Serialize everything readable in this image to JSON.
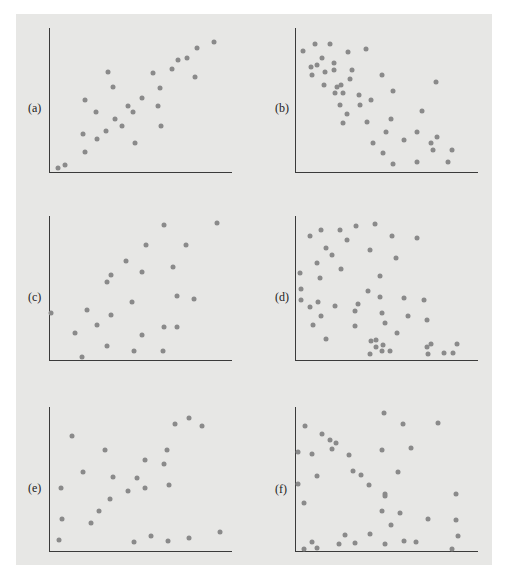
{
  "caption": "Figure",
  "chart_data": [
    {
      "type": "scatter",
      "panel": "(a)",
      "label": "(a)",
      "xlabel": "",
      "ylabel": "",
      "grid": false,
      "trend": "strong positive",
      "points": [
        [
          9,
          5
        ],
        [
          16,
          8
        ],
        [
          36,
          21
        ],
        [
          34,
          39
        ],
        [
          36,
          73
        ],
        [
          48,
          34
        ],
        [
          47,
          61
        ],
        [
          57,
          42
        ],
        [
          59,
          101
        ],
        [
          64,
          86
        ],
        [
          66,
          54
        ],
        [
          73,
          47
        ],
        [
          79,
          67
        ],
        [
          84,
          61
        ],
        [
          86,
          30
        ],
        [
          93,
          75
        ],
        [
          104,
          100
        ],
        [
          109,
          67
        ],
        [
          111,
          85
        ],
        [
          112,
          47
        ],
        [
          123,
          104
        ],
        [
          129,
          113
        ],
        [
          138,
          115
        ],
        [
          146,
          96
        ],
        [
          148,
          125
        ],
        [
          165,
          131
        ]
      ]
    },
    {
      "type": "scatter",
      "panel": "(b)",
      "label": "(b)",
      "xlabel": "",
      "ylabel": "",
      "grid": false,
      "trend": "negative",
      "points": [
        [
          8,
          122
        ],
        [
          20,
          129
        ],
        [
          35,
          129
        ],
        [
          53,
          121
        ],
        [
          71,
          124
        ],
        [
          16,
          106
        ],
        [
          22,
          108
        ],
        [
          27,
          115
        ],
        [
          39,
          110
        ],
        [
          17,
          98
        ],
        [
          30,
          101
        ],
        [
          39,
          103
        ],
        [
          57,
          103
        ],
        [
          55,
          94
        ],
        [
          29,
          88
        ],
        [
          42,
          86
        ],
        [
          46,
          88
        ],
        [
          40,
          80
        ],
        [
          48,
          80
        ],
        [
          64,
          78
        ],
        [
          65,
          68
        ],
        [
          76,
          73
        ],
        [
          45,
          68
        ],
        [
          52,
          59
        ],
        [
          48,
          50
        ],
        [
          72,
          51
        ],
        [
          87,
          98
        ],
        [
          98,
          82
        ],
        [
          96,
          54
        ],
        [
          91,
          41
        ],
        [
          78,
          30
        ],
        [
          88,
          20
        ],
        [
          98,
          9
        ],
        [
          109,
          33
        ],
        [
          122,
          41
        ],
        [
          127,
          62
        ],
        [
          141,
          91
        ],
        [
          122,
          11
        ],
        [
          136,
          30
        ],
        [
          142,
          36
        ],
        [
          138,
          23
        ],
        [
          157,
          23
        ],
        [
          153,
          11
        ]
      ]
    },
    {
      "type": "scatter",
      "panel": "(c)",
      "label": "(c)",
      "xlabel": "",
      "ylabel": "",
      "grid": false,
      "trend": "weak positive",
      "points": [
        [
          2,
          48
        ],
        [
          26,
          28
        ],
        [
          33,
          4
        ],
        [
          38,
          51
        ],
        [
          48,
          36
        ],
        [
          58,
          15
        ],
        [
          62,
          46
        ],
        [
          58,
          79
        ],
        [
          62,
          86
        ],
        [
          77,
          100
        ],
        [
          83,
          59
        ],
        [
          85,
          10
        ],
        [
          93,
          89
        ],
        [
          93,
          26
        ],
        [
          97,
          116
        ],
        [
          115,
          136
        ],
        [
          114,
          10
        ],
        [
          115,
          34
        ],
        [
          124,
          94
        ],
        [
          128,
          65
        ],
        [
          128,
          34
        ],
        [
          137,
          116
        ],
        [
          145,
          62
        ],
        [
          168,
          138
        ]
      ]
    },
    {
      "type": "scatter",
      "panel": "(d)",
      "label": "(d)",
      "xlabel": "",
      "ylabel": "",
      "grid": false,
      "trend": "weak negative",
      "points": [
        [
          15,
          125
        ],
        [
          26,
          131
        ],
        [
          45,
          131
        ],
        [
          61,
          135
        ],
        [
          80,
          137
        ],
        [
          52,
          121
        ],
        [
          97,
          125
        ],
        [
          122,
          123
        ],
        [
          31,
          113
        ],
        [
          37,
          106
        ],
        [
          75,
          111
        ],
        [
          101,
          103
        ],
        [
          22,
          98
        ],
        [
          46,
          92
        ],
        [
          5,
          88
        ],
        [
          25,
          83
        ],
        [
          85,
          85
        ],
        [
          6,
          72
        ],
        [
          6,
          61
        ],
        [
          73,
          70
        ],
        [
          85,
          64
        ],
        [
          109,
          63
        ],
        [
          129,
          61
        ],
        [
          15,
          54
        ],
        [
          23,
          59
        ],
        [
          40,
          55
        ],
        [
          63,
          57
        ],
        [
          60,
          50
        ],
        [
          26,
          45
        ],
        [
          87,
          48
        ],
        [
          113,
          45
        ],
        [
          132,
          41
        ],
        [
          18,
          36
        ],
        [
          60,
          35
        ],
        [
          90,
          38
        ],
        [
          102,
          28
        ],
        [
          31,
          22
        ],
        [
          76,
          20
        ],
        [
          81,
          21
        ],
        [
          81,
          14
        ],
        [
          88,
          16
        ],
        [
          75,
          7
        ],
        [
          87,
          10
        ],
        [
          95,
          10
        ],
        [
          132,
          14
        ],
        [
          136,
          17
        ],
        [
          133,
          7
        ],
        [
          149,
          8
        ],
        [
          158,
          8
        ],
        [
          162,
          17
        ]
      ]
    },
    {
      "type": "scatter",
      "panel": "(e)",
      "label": "(e)",
      "xlabel": "",
      "ylabel": "",
      "grid": false,
      "trend": "weak positive",
      "points": [
        [
          10,
          12
        ],
        [
          13,
          33
        ],
        [
          12,
          64
        ],
        [
          23,
          116
        ],
        [
          34,
          80
        ],
        [
          42,
          29
        ],
        [
          50,
          41
        ],
        [
          56,
          102
        ],
        [
          61,
          53
        ],
        [
          64,
          75
        ],
        [
          79,
          61
        ],
        [
          85,
          10
        ],
        [
          88,
          74
        ],
        [
          96,
          92
        ],
        [
          96,
          64
        ],
        [
          102,
          16
        ],
        [
          115,
          88
        ],
        [
          118,
          102
        ],
        [
          120,
          67
        ],
        [
          119,
          11
        ],
        [
          126,
          128
        ],
        [
          140,
          134
        ],
        [
          140,
          14
        ],
        [
          153,
          126
        ],
        [
          171,
          20
        ]
      ]
    },
    {
      "type": "scatter",
      "panel": "(f)",
      "label": "(f)",
      "xlabel": "",
      "ylabel": "",
      "grid": false,
      "trend": "none",
      "points": [
        [
          10,
          126
        ],
        [
          3,
          100
        ],
        [
          3,
          68
        ],
        [
          9,
          49
        ],
        [
          9,
          3
        ],
        [
          17,
          98
        ],
        [
          22,
          76
        ],
        [
          17,
          10
        ],
        [
          22,
          4
        ],
        [
          27,
          118
        ],
        [
          35,
          112
        ],
        [
          41,
          109
        ],
        [
          37,
          103
        ],
        [
          54,
          97
        ],
        [
          58,
          81
        ],
        [
          66,
          77
        ],
        [
          74,
          67
        ],
        [
          50,
          17
        ],
        [
          44,
          8
        ],
        [
          60,
          9
        ],
        [
          75,
          18
        ],
        [
          89,
          139
        ],
        [
          87,
          102
        ],
        [
          108,
          128
        ],
        [
          116,
          104
        ],
        [
          103,
          80
        ],
        [
          90,
          58
        ],
        [
          90,
          56
        ],
        [
          87,
          41
        ],
        [
          96,
          27
        ],
        [
          105,
          39
        ],
        [
          90,
          8
        ],
        [
          109,
          11
        ],
        [
          121,
          10
        ],
        [
          143,
          129
        ],
        [
          133,
          33
        ],
        [
          161,
          58
        ],
        [
          161,
          32
        ],
        [
          163,
          16
        ],
        [
          157,
          3
        ]
      ]
    }
  ],
  "layout": {
    "plots": [
      {
        "left": 49,
        "top": 28,
        "label_left": 28,
        "label_top": 101
      },
      {
        "left": 295,
        "top": 28,
        "label_left": 275,
        "label_top": 101
      },
      {
        "left": 49,
        "top": 216,
        "label_left": 28,
        "label_top": 290
      },
      {
        "left": 295,
        "top": 216,
        "label_left": 275,
        "label_top": 290
      },
      {
        "left": 49,
        "top": 407,
        "label_left": 28,
        "label_top": 481
      },
      {
        "left": 295,
        "top": 407,
        "label_left": 275,
        "label_top": 482
      }
    ],
    "dot_color": "#8a8a8a",
    "axis_color": "#3a3a3a",
    "panel_color": "#e7e7e5"
  }
}
